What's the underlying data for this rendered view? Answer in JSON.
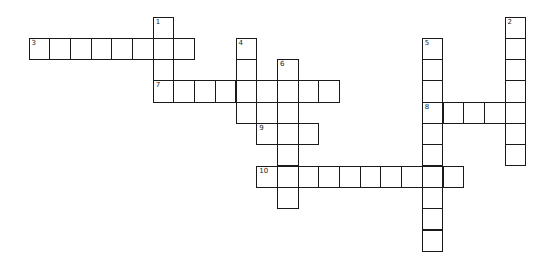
{
  "puzzle": {
    "grid": {
      "origin_x": 29,
      "origin_y": 17,
      "cell_w": 20.7,
      "cell_h": 21.3
    },
    "colors": {
      "border": "#1a1a1a",
      "cell_bg": "#ffffff",
      "page_bg": "#ffffff"
    },
    "entries": [
      {
        "number": "1",
        "direction": "down",
        "row": 0,
        "col": 6,
        "length": 4
      },
      {
        "number": "2",
        "direction": "down",
        "row": 0,
        "col": 23,
        "length": 7
      },
      {
        "number": "3",
        "direction": "across",
        "row": 1,
        "col": 0,
        "length": 8
      },
      {
        "number": "4",
        "direction": "down",
        "row": 1,
        "col": 10,
        "length": 4
      },
      {
        "number": "5",
        "direction": "down",
        "row": 1,
        "col": 19,
        "length": 10
      },
      {
        "number": "6",
        "direction": "down",
        "row": 2,
        "col": 12,
        "length": 7
      },
      {
        "number": "7",
        "direction": "across",
        "row": 3,
        "col": 6,
        "length": 9
      },
      {
        "number": "8",
        "direction": "across",
        "row": 4,
        "col": 19,
        "length": 5
      },
      {
        "number": "9",
        "direction": "across",
        "row": 5,
        "col": 11,
        "length": 3
      },
      {
        "number": "10",
        "direction": "across",
        "row": 7,
        "col": 11,
        "length": 10
      }
    ]
  }
}
